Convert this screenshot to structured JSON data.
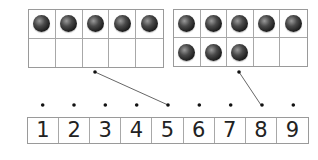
{
  "ten_frames": [
    {
      "id": "left",
      "filled": [
        true,
        true,
        true,
        true,
        true,
        false,
        false,
        false,
        false,
        false
      ],
      "count": 5
    },
    {
      "id": "right",
      "filled": [
        true,
        true,
        true,
        true,
        true,
        true,
        true,
        true,
        false,
        false
      ],
      "count": 8
    }
  ],
  "number_line": {
    "numbers": [
      "1",
      "2",
      "3",
      "4",
      "5",
      "6",
      "7",
      "8",
      "9"
    ]
  },
  "matches": [
    {
      "frame": "left",
      "number": "5"
    },
    {
      "frame": "right",
      "number": "8"
    }
  ],
  "colors": {
    "grid_line": "#a8a8a8",
    "counter": "#2a2a2a",
    "connector": "#555555",
    "text": "#222222"
  }
}
